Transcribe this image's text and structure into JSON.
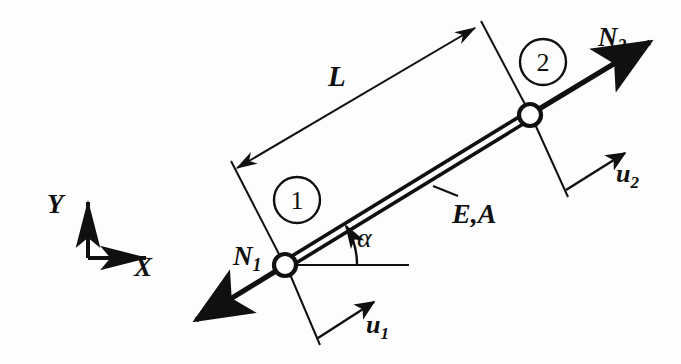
{
  "figure": {
    "background_color": "#fdfdfd",
    "ink_color": "#101010"
  },
  "labels": {
    "length": "L",
    "force_node_1": "N",
    "force_node_1_sub": "1",
    "force_node_2": "N",
    "force_node_2_sub": "2",
    "displacement_node_1": "u",
    "displacement_node_1_sub": "1",
    "displacement_node_2": "u",
    "displacement_node_2_sub": "2",
    "material_section": "E,A",
    "angle": "α",
    "axis_x": "X",
    "axis_y": "Y",
    "node_1_number": "1",
    "node_2_number": "2"
  },
  "geometry": {
    "node_1": {
      "x": 285,
      "y": 265,
      "radius": 11
    },
    "node_2": {
      "x": 530,
      "y": 115,
      "radius": 11
    },
    "bar_angle_deg": 31.5,
    "bar_half_gap": 3.2,
    "axis_origin": {
      "x": 88,
      "y": 258
    },
    "axis_x_tip": {
      "x": 152,
      "y": 258
    },
    "axis_y_tip": {
      "x": 88,
      "y": 196
    },
    "dimension_line": {
      "start": {
        "x": 237,
        "y": 168
      },
      "end": {
        "x": 475,
        "y": 28
      }
    },
    "element_circle_1": {
      "x": 297,
      "y": 200,
      "radius": 23
    },
    "element_circle_2": {
      "x": 543,
      "y": 62,
      "radius": 23
    },
    "angle_arc_radius": 72,
    "angle_arc_start_deg": 0,
    "angle_arc_end_deg": 31.5
  }
}
